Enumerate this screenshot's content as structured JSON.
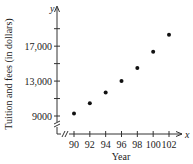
{
  "chart_data": {
    "type": "scatter",
    "title": "",
    "xlabel": "Year",
    "ylabel": "Tuition and fees (in dollars)",
    "x_axis_letter": "x",
    "y_axis_letter": "y",
    "x_ticks": [
      90,
      92,
      94,
      96,
      98,
      100,
      102
    ],
    "x_tick_labels": [
      "90",
      "92",
      "94",
      "96",
      "98",
      "100",
      "102"
    ],
    "y_ticks": [
      9000,
      11000,
      13000,
      15000,
      17000,
      19000
    ],
    "y_tick_labels": [
      "9000",
      "",
      "13,000",
      "",
      "17,000",
      ""
    ],
    "xlim": [
      88.5,
      103.5
    ],
    "ylim": [
      8500,
      20000
    ],
    "axis_breaks": [
      "x",
      "y"
    ],
    "grid": false,
    "legend": null,
    "series": [
      {
        "name": "Tuition and fees",
        "x": [
          90,
          92,
          94,
          96,
          98,
          100,
          102
        ],
        "y": [
          9300,
          10450,
          11700,
          13000,
          14500,
          16350,
          18300
        ]
      }
    ]
  },
  "colors": {
    "axis": "#333333",
    "point": "#111111",
    "text": "#222222"
  }
}
